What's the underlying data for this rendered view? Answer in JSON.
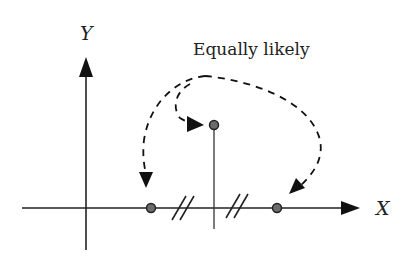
{
  "diagram": {
    "annotation": "Equally likely",
    "x_axis_label": "X",
    "y_axis_label": "Y",
    "colors": {
      "stroke": "#222222",
      "point_fill": "#6b6b6b",
      "background": "#ffffff"
    },
    "points": [
      {
        "name": "left-point",
        "x": 151,
        "y": 208
      },
      {
        "name": "center-point",
        "x": 214,
        "y": 125
      },
      {
        "name": "right-point",
        "x": 277,
        "y": 208
      }
    ],
    "equal_spacing_ticks": 2,
    "arrow_count": 3
  }
}
